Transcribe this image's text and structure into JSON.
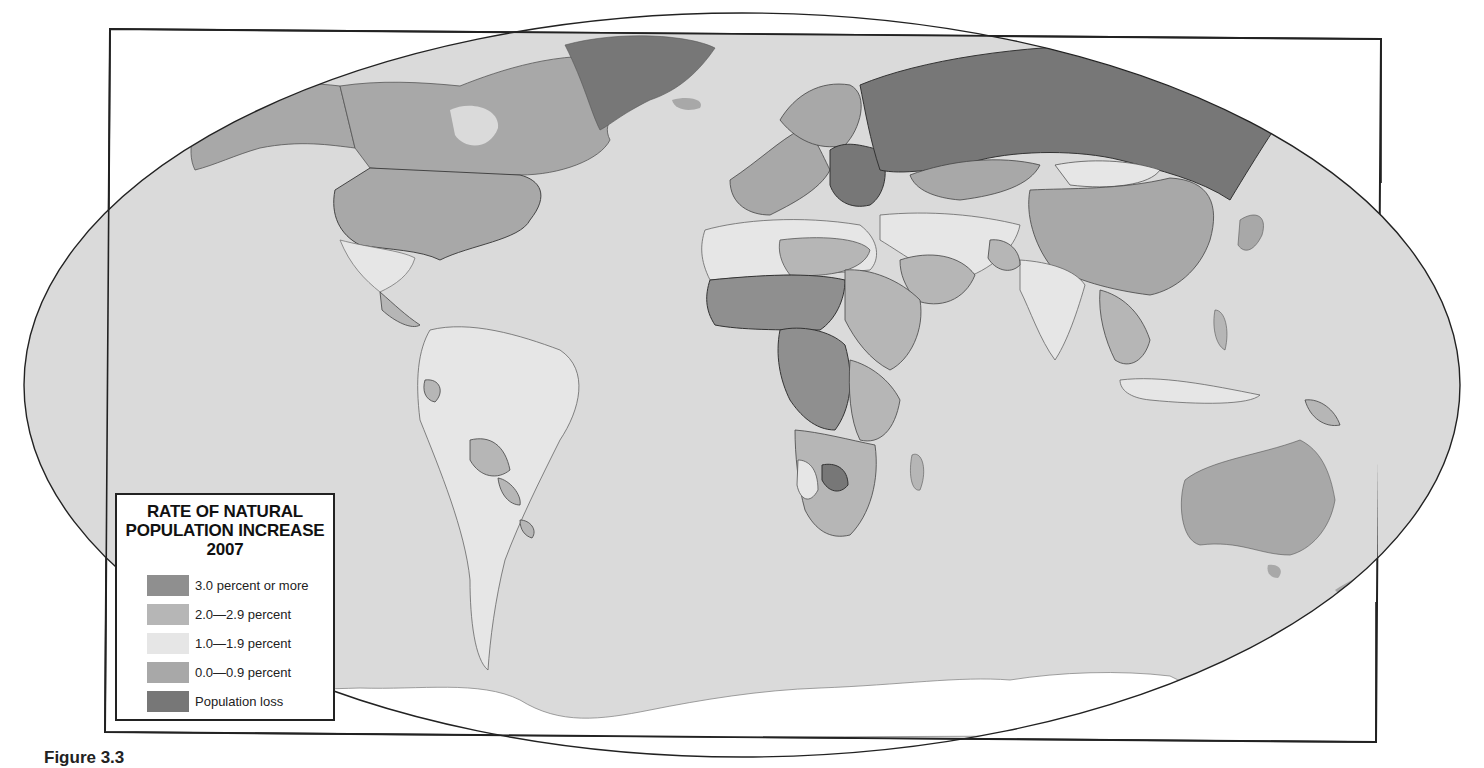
{
  "map": {
    "title_lines": [
      "RATE OF NATURAL",
      "POPULATION INCREASE",
      "2007"
    ],
    "projection": "elliptical world map",
    "colors": {
      "ocean": "#dadada",
      "no_data_land": "#ffffff",
      "border": "#444444",
      "frame": "#222222"
    }
  },
  "legend": {
    "title_line1": "RATE OF NATURAL",
    "title_line2": "POPULATION INCREASE",
    "title_line3": "2007",
    "items": [
      {
        "label": "3.0 percent or more",
        "color": "#8f8f8f"
      },
      {
        "label": "2.0—2.9 percent",
        "color": "#b6b6b6"
      },
      {
        "label": "1.0—1.9 percent",
        "color": "#e6e6e6"
      },
      {
        "label": "0.0—0.9 percent",
        "color": "#a8a8a8"
      },
      {
        "label": "Population loss",
        "color": "#777777"
      }
    ]
  },
  "regions": [
    {
      "name": "Greenland",
      "class": "Population loss"
    },
    {
      "name": "Russia",
      "class": "Population loss"
    },
    {
      "name": "Eastern Europe",
      "class": "Population loss"
    },
    {
      "name": "Canada",
      "class": "0.0—0.9 percent"
    },
    {
      "name": "United States",
      "class": "0.0—0.9 percent"
    },
    {
      "name": "Western Europe",
      "class": "0.0—0.9 percent"
    },
    {
      "name": "China",
      "class": "0.0—0.9 percent"
    },
    {
      "name": "Australia",
      "class": "0.0—0.9 percent"
    },
    {
      "name": "Kazakhstan",
      "class": "0.0—0.9 percent"
    },
    {
      "name": "Mexico",
      "class": "1.0—1.9 percent"
    },
    {
      "name": "South America",
      "class": "1.0—1.9 percent"
    },
    {
      "name": "India",
      "class": "1.0—1.9 percent"
    },
    {
      "name": "Mongolia",
      "class": "1.0—1.9 percent"
    },
    {
      "name": "Southeast Asia",
      "class": "1.0—1.9 percent"
    },
    {
      "name": "North Africa",
      "class": "1.0—1.9 percent"
    },
    {
      "name": "Bolivia / Paraguay",
      "class": "2.0—2.9 percent"
    },
    {
      "name": "Central America",
      "class": "2.0—2.9 percent"
    },
    {
      "name": "Sudan / Ethiopia",
      "class": "2.0—2.9 percent"
    },
    {
      "name": "Saudi Arabia",
      "class": "2.0—2.9 percent"
    },
    {
      "name": "Sahel / West Africa",
      "class": "3.0 percent or more"
    },
    {
      "name": "DR Congo",
      "class": "3.0 percent or more"
    },
    {
      "name": "Botswana",
      "class": "3.0 percent or more"
    }
  ],
  "caption": {
    "text": "Figure 3.3"
  }
}
